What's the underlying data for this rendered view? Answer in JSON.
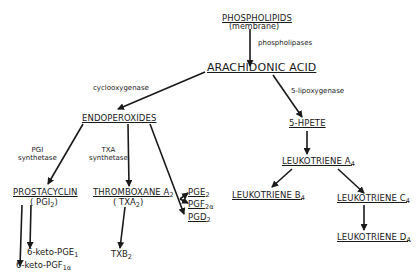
{
  "nodes": {
    "phospholipids": {
      "label": "PHOSPHOLIPIDS",
      "sub_label": "(membrane)"
    },
    "arachidonic": {
      "label": "ARACHIDONIC ACID"
    },
    "endoperoxides": {
      "label": "ENDOPEROXIDES"
    },
    "hpete": {
      "label": "5-HPETE"
    },
    "prostacyclin": {
      "label": "PROSTACYCLIN",
      "abbr": "( PGI",
      "abbr_sub": "2",
      "abbr_end": ")"
    },
    "thromboxane": {
      "label": "THROMBOXANE A",
      "label_sub": "2",
      "abbr": "( TXA",
      "abbr_sub": "2",
      "abbr_end": ")"
    },
    "pge2": {
      "label": "PGE",
      "sub": "2"
    },
    "pgf2a": {
      "label": "PGF",
      "sub": "2α"
    },
    "pgd2": {
      "label": "PGD",
      "sub": "2"
    },
    "lta4": {
      "label": "LEUKOTRIENE A",
      "sub": "4"
    },
    "ltb4": {
      "label": "LEUKOTRIENE B",
      "sub": "4"
    },
    "ltc4": {
      "label": "LEUKOTRIENE C",
      "sub": "4"
    },
    "ltd4": {
      "label": "LEUKOTRIENE D",
      "sub": "4"
    },
    "keto_pge1": {
      "label": "6-keto-PGE",
      "sub": "1"
    },
    "keto_pgf1a": {
      "label": "6-keto-PGF",
      "sub": "1α"
    },
    "txb2": {
      "label": "TXB",
      "sub": "2"
    }
  },
  "enzymes": {
    "phospholipases": "phospholipases",
    "cyclooxygenase": "cyclooxygenase",
    "lipoxygenase": "5-lipoxygenase",
    "pgi_synthetase": {
      "line1": "PGI",
      "line2": "synthetase"
    },
    "txa_synthetase": {
      "line1": "TXA",
      "line2": "synthetase"
    }
  },
  "arrows": [
    {
      "from": "phospholipids",
      "to": "arachidonic",
      "enzyme": "phospholipases"
    },
    {
      "from": "arachidonic",
      "to": "endoperoxides",
      "enzyme": "cyclooxygenase"
    },
    {
      "from": "arachidonic",
      "to": "hpete",
      "enzyme": "5-lipoxygenase"
    },
    {
      "from": "endoperoxides",
      "to": "prostacyclin",
      "enzyme": "PGI synthetase"
    },
    {
      "from": "endoperoxides",
      "to": "thromboxane",
      "enzyme": "TXA synthetase"
    },
    {
      "from": "endoperoxides",
      "to": "pge2"
    },
    {
      "from": "endoperoxides",
      "to": "pgf2a"
    },
    {
      "from": "endoperoxides",
      "to": "pgd2"
    },
    {
      "from": "prostacyclin",
      "to": "keto_pge1"
    },
    {
      "from": "prostacyclin",
      "to": "keto_pgf1a"
    },
    {
      "from": "thromboxane",
      "to": "txb2"
    },
    {
      "from": "hpete",
      "to": "lta4"
    },
    {
      "from": "lta4",
      "to": "ltb4"
    },
    {
      "from": "lta4",
      "to": "ltc4"
    },
    {
      "from": "ltc4",
      "to": "ltd4"
    }
  ]
}
